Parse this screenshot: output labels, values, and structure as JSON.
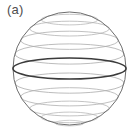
{
  "figure": {
    "panel_label": "(a)",
    "label_color": "#4d4d4d",
    "background_color": "#ffffff",
    "caption_alt": "sphere with latitude circles and highlighted equator"
  },
  "chart_data": {
    "type": "diagram",
    "title": "(a)",
    "sphere": {
      "center_x": 69.5,
      "center_y": 68.5,
      "radius": 56.5,
      "outline_color": "#6e6e6e",
      "outline_width": 1.0,
      "fill": "none"
    },
    "equator": {
      "label": "equator",
      "latitude_deg": 0,
      "center_y": 68.5,
      "rx": 56.5,
      "ry": 10.5,
      "stroke_color": "#3b3b3b",
      "stroke_width": 1.6,
      "emphasis": true
    },
    "latitudes": [
      {
        "latitude_deg": 60,
        "center_y": 19.6,
        "rx": 28.3,
        "ry": 5.3,
        "stroke_color": "#b9b9b9",
        "stroke_width": 0.8
      },
      {
        "latitude_deg": 45,
        "center_y": 28.6,
        "rx": 39.9,
        "ry": 7.4,
        "stroke_color": "#b4b4b4",
        "stroke_width": 0.8
      },
      {
        "latitude_deg": 30,
        "center_y": 40.3,
        "rx": 48.9,
        "ry": 9.1,
        "stroke_color": "#b0b0b0",
        "stroke_width": 0.8
      },
      {
        "latitude_deg": 15,
        "center_y": 54.0,
        "rx": 54.6,
        "ry": 10.1,
        "stroke_color": "#ababab",
        "stroke_width": 0.8
      },
      {
        "latitude_deg": -15,
        "center_y": 83.1,
        "rx": 54.6,
        "ry": 10.1,
        "stroke_color": "#ababab",
        "stroke_width": 0.8
      },
      {
        "latitude_deg": -30,
        "center_y": 96.8,
        "rx": 48.9,
        "ry": 9.1,
        "stroke_color": "#b0b0b0",
        "stroke_width": 0.8
      },
      {
        "latitude_deg": -45,
        "center_y": 108.5,
        "rx": 39.9,
        "ry": 7.4,
        "stroke_color": "#b4b4b4",
        "stroke_width": 0.8
      },
      {
        "latitude_deg": -60,
        "center_y": 117.4,
        "rx": 28.3,
        "ry": 5.3,
        "stroke_color": "#b9b9b9",
        "stroke_width": 0.8
      },
      {
        "latitude_deg": -75,
        "center_y": 123.1,
        "rx": 14.6,
        "ry": 2.8,
        "stroke_color": "#c4c4c4",
        "stroke_width": 0.8
      }
    ],
    "grid": false,
    "legend": null,
    "xlabel": "",
    "ylabel": ""
  }
}
